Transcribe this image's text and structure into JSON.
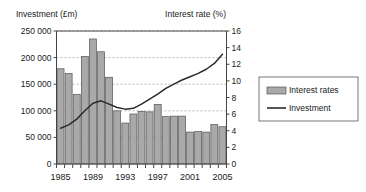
{
  "chart_data": {
    "type": "bar",
    "title": "",
    "subtitle": "",
    "xlabel": "",
    "ylabel": "Investment (£m)",
    "y2label": "Interest rate (%)",
    "grid": true,
    "legend_position": "right",
    "x": [
      1985,
      1986,
      1987,
      1988,
      1989,
      1990,
      1991,
      1992,
      1993,
      1994,
      1995,
      1996,
      1997,
      1998,
      1999,
      2000,
      2001,
      2002,
      2003,
      2004,
      2005
    ],
    "categories": [
      "1985",
      "1986",
      "1987",
      "1988",
      "1989",
      "1990",
      "1991",
      "1992",
      "1993",
      "1994",
      "1995",
      "1996",
      "1997",
      "1998",
      "1999",
      "2000",
      "2001",
      "2002",
      "2003",
      "2004",
      "2005"
    ],
    "xticks": [
      "1985",
      "1989",
      "1993",
      "1997",
      "2001",
      "2005"
    ],
    "xtick_values": [
      1985,
      1989,
      1993,
      1997,
      2001,
      2005
    ],
    "yticks": [
      "0",
      "50 000",
      "100 000",
      "150 000",
      "200 000",
      "250 000"
    ],
    "ytick_values": [
      0,
      50000,
      100000,
      150000,
      200000,
      250000
    ],
    "ylim": [
      0,
      250000
    ],
    "y2ticks": [
      "0",
      "2",
      "4",
      "6",
      "8",
      "10",
      "12",
      "14",
      "16"
    ],
    "y2tick_values": [
      0,
      2,
      4,
      6,
      8,
      10,
      12,
      14,
      16
    ],
    "y2lim": [
      0,
      16
    ],
    "series": [
      {
        "name": "Interest rates",
        "type": "bar",
        "axis": "left",
        "color": "#a9a9a9",
        "edge_color": "#555555",
        "values": [
          179000,
          170000,
          131000,
          202000,
          235000,
          211000,
          163000,
          100000,
          77000,
          94000,
          99000,
          98000,
          112000,
          89000,
          90000,
          90000,
          60000,
          61000,
          60000,
          74000,
          70000
        ]
      },
      {
        "name": "Investment",
        "type": "line",
        "axis": "right",
        "color": "#2b2b2b",
        "values": [
          4.3,
          4.7,
          5.4,
          6.4,
          7.3,
          7.6,
          7.2,
          6.8,
          6.6,
          6.7,
          7.2,
          7.8,
          8.4,
          9.1,
          9.6,
          10.1,
          10.5,
          10.9,
          11.4,
          12.1,
          13.2
        ]
      }
    ]
  },
  "legend": {
    "items": [
      {
        "label": "Interest rates",
        "marker": "bar-swatch",
        "color": "#a9a9a9"
      },
      {
        "label": "Investment",
        "marker": "line-swatch",
        "color": "#2b2b2b"
      }
    ]
  }
}
